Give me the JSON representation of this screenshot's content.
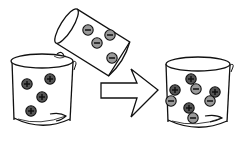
{
  "diagram": {
    "colors": {
      "line": "#111111",
      "background": "#ffffff",
      "positive_ion_fill": "#555555",
      "negative_ion_fill": "#9a9a9a",
      "ion_sign": "#111111",
      "arrow_fill": "#ffffff"
    },
    "beakers": [
      {
        "id": "left-beaker",
        "role": "positive ion solution",
        "ions": [
          {
            "sign": "+",
            "x": 27,
            "y": 84
          },
          {
            "sign": "+",
            "x": 50,
            "y": 79
          },
          {
            "sign": "+",
            "x": 42,
            "y": 97
          },
          {
            "sign": "+",
            "x": 31,
            "y": 111
          }
        ]
      },
      {
        "id": "pouring-beaker",
        "role": "negative ion solution (tilted, pouring)",
        "ions": [
          {
            "sign": "−",
            "x": 88,
            "y": 30
          },
          {
            "sign": "−",
            "x": 110,
            "y": 35
          },
          {
            "sign": "−",
            "x": 97,
            "y": 43
          },
          {
            "sign": "−",
            "x": 112,
            "y": 58
          }
        ]
      },
      {
        "id": "result-beaker",
        "role": "mixed solution",
        "ions": [
          {
            "sign": "+",
            "x": 191,
            "y": 79
          },
          {
            "sign": "−",
            "x": 196,
            "y": 89
          },
          {
            "sign": "+",
            "x": 175,
            "y": 90
          },
          {
            "sign": "−",
            "x": 171,
            "y": 101
          },
          {
            "sign": "+",
            "x": 215,
            "y": 92
          },
          {
            "sign": "−",
            "x": 210,
            "y": 101
          },
          {
            "sign": "+",
            "x": 189,
            "y": 108
          },
          {
            "sign": "−",
            "x": 193,
            "y": 118
          }
        ]
      }
    ],
    "arrow": {
      "direction": "right",
      "icon": "right-arrow-icon"
    }
  }
}
